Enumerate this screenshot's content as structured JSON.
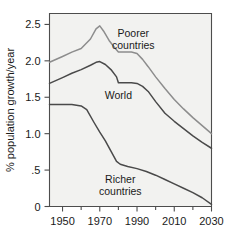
{
  "chart_data": {
    "type": "line",
    "title": "",
    "subtitle": "",
    "xlabel": "",
    "ylabel": "% population growth/year",
    "xlim": [
      1943,
      2030
    ],
    "ylim": [
      0,
      2.65
    ],
    "grid": false,
    "legend_position": "inline-annotations",
    "x_ticks": [
      1950,
      1970,
      1990,
      2010,
      2030
    ],
    "x_tick_labels": [
      "1950",
      "1970",
      "1990",
      "2010",
      "2030"
    ],
    "x_minor_ticks": [
      1960,
      1980,
      2000,
      2020
    ],
    "y_ticks": [
      0,
      0.5,
      1.0,
      1.5,
      2.0,
      2.5
    ],
    "y_tick_labels": [
      "0",
      ".5",
      "1.0",
      "1.5",
      "2.0",
      "2.5"
    ],
    "annotations": [
      {
        "text_line1": "Poorer",
        "text_line2": "countries",
        "x": 1988,
        "y": 2.33
      },
      {
        "text_line1": "World",
        "text_line2": "",
        "x": 1980,
        "y": 1.47
      },
      {
        "text_line1": "Richer",
        "text_line2": "countries",
        "x": 1981,
        "y": 0.32
      }
    ],
    "series": [
      {
        "name": "Poorer countries",
        "color": "#8d8d8d",
        "x": [
          1943,
          1950,
          1955,
          1960,
          1965,
          1968,
          1970,
          1972,
          1975,
          1978,
          1980,
          1983,
          1987,
          1990,
          1993,
          1996,
          2000,
          2005,
          2010,
          2015,
          2020,
          2025,
          2030
        ],
        "values": [
          1.98,
          2.06,
          2.12,
          2.17,
          2.3,
          2.44,
          2.48,
          2.41,
          2.28,
          2.18,
          2.12,
          2.12,
          2.12,
          2.1,
          2.02,
          1.92,
          1.78,
          1.62,
          1.47,
          1.34,
          1.22,
          1.11,
          1.0
        ]
      },
      {
        "name": "World",
        "color": "#4a4a4a",
        "x": [
          1943,
          1950,
          1955,
          1960,
          1965,
          1968,
          1970,
          1973,
          1976,
          1979,
          1980,
          1983,
          1987,
          1990,
          1993,
          1996,
          2000,
          2005,
          2010,
          2015,
          2020,
          2025,
          2030
        ],
        "values": [
          1.69,
          1.77,
          1.83,
          1.88,
          1.94,
          1.98,
          1.99,
          1.95,
          1.88,
          1.78,
          1.7,
          1.7,
          1.7,
          1.69,
          1.65,
          1.58,
          1.44,
          1.28,
          1.17,
          1.07,
          0.97,
          0.88,
          0.8
        ]
      },
      {
        "name": "Richer countries",
        "color": "#4a4a4a",
        "x": [
          1943,
          1950,
          1955,
          1960,
          1963,
          1967,
          1970,
          1973,
          1976,
          1979,
          1981,
          1985,
          1990,
          1995,
          2000,
          2005,
          2010,
          2015,
          2020,
          2025,
          2030
        ],
        "values": [
          1.4,
          1.4,
          1.4,
          1.38,
          1.33,
          1.15,
          1.02,
          0.9,
          0.76,
          0.62,
          0.58,
          0.55,
          0.52,
          0.48,
          0.43,
          0.37,
          0.31,
          0.25,
          0.19,
          0.12,
          0.03
        ]
      }
    ]
  },
  "axes": {
    "y_axis_label": "% population growth/year"
  }
}
